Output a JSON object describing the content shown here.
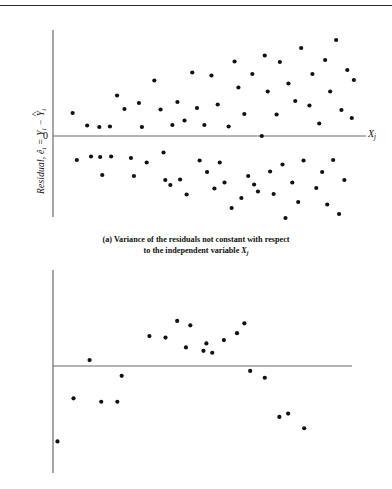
{
  "figure": {
    "top_rule": true,
    "panels": [
      {
        "id": "a",
        "tag": "(a)",
        "caption_line1": "(a)  Variance of the residuals not constant with respect",
        "caption_line2": "to the independent variable",
        "caption_var": "X",
        "caption_var_sub": "j",
        "ylabel_text": "Residual, ê",
        "ylabel_sub": "i",
        "ylabel_eq": " = Y",
        "ylabel_eq_sub": "i",
        "ylabel_minus": " − ",
        "ylabel_yhat": "Y",
        "ylabel_yhat_sub": "i",
        "zero_label": "0",
        "xlabel": "X",
        "xlabel_sub": "j"
      },
      {
        "id": "b",
        "tag": "(b)",
        "ylabel_text": "Residual, ê",
        "ylabel_sub": "i",
        "ylabel_eq": " = Y",
        "ylabel_eq_sub": "i",
        "ylabel_minus": " − ",
        "ylabel_yhat": "Y",
        "ylabel_yhat_sub": "i",
        "zero_label": "0",
        "xlabel": "X",
        "xlabel_sub": "j"
      }
    ]
  },
  "chart_data": [
    {
      "type": "scatter",
      "title": "(a) Variance of the residuals not constant with respect to the independent variable Xj",
      "xlabel": "Xj",
      "ylabel": "Residual, e-hat i = Yi - Y-hat i",
      "grid": false,
      "legend": null,
      "xlim": [
        0,
        100
      ],
      "ylim": [
        -100,
        100
      ],
      "zero_line": 0,
      "marker": "filled-circle",
      "marker_color": "#111111",
      "marker_size_px": 4.2,
      "axis_color": "#6a6a6a",
      "points": [
        [
          3.6,
          23.0
        ],
        [
          5.0,
          -24.0
        ],
        [
          8.5,
          10.5
        ],
        [
          9.8,
          -20.5
        ],
        [
          12.6,
          9.0
        ],
        [
          12.9,
          -21.0
        ],
        [
          13.6,
          -39.0
        ],
        [
          16.2,
          9.5
        ],
        [
          16.6,
          -20.5
        ],
        [
          18.6,
          40.5
        ],
        [
          21.1,
          27.0
        ],
        [
          23.3,
          -22.0
        ],
        [
          24.3,
          -40.0
        ],
        [
          26.0,
          33.0
        ],
        [
          27.0,
          9.0
        ],
        [
          28.6,
          -26.5
        ],
        [
          31.2,
          55.5
        ],
        [
          33.3,
          26.5
        ],
        [
          34.3,
          -16.5
        ],
        [
          34.9,
          -44.0
        ],
        [
          36.6,
          -49.0
        ],
        [
          37.3,
          11.0
        ],
        [
          39.0,
          34.0
        ],
        [
          39.9,
          -43.5
        ],
        [
          41.4,
          15.5
        ],
        [
          42.1,
          -58.5
        ],
        [
          44.0,
          63.5
        ],
        [
          45.6,
          28.0
        ],
        [
          46.5,
          -24.5
        ],
        [
          48.1,
          11.0
        ],
        [
          49.0,
          -36.0
        ],
        [
          50.5,
          60.5
        ],
        [
          51.5,
          -52.5
        ],
        [
          52.6,
          31.5
        ],
        [
          53.3,
          -26.5
        ],
        [
          54.9,
          -46.5
        ],
        [
          56.3,
          9.5
        ],
        [
          57.3,
          -72.0
        ],
        [
          58.3,
          74.5
        ],
        [
          59.6,
          48.5
        ],
        [
          60.6,
          -62.0
        ],
        [
          61.6,
          22.0
        ],
        [
          62.9,
          -40.0
        ],
        [
          64.3,
          62.0
        ],
        [
          64.9,
          -48.5
        ],
        [
          66.2,
          -55.5
        ],
        [
          67.5,
          0.0
        ],
        [
          68.5,
          80.5
        ],
        [
          69.5,
          44.5
        ],
        [
          70.3,
          -35.5
        ],
        [
          71.5,
          -58.0
        ],
        [
          72.5,
          21.5
        ],
        [
          73.6,
          74.0
        ],
        [
          74.5,
          -28.5
        ],
        [
          75.5,
          -82.0
        ],
        [
          76.5,
          52.5
        ],
        [
          77.8,
          -46.5
        ],
        [
          78.8,
          35.0
        ],
        [
          79.8,
          -66.0
        ],
        [
          80.8,
          88.0
        ],
        [
          81.6,
          -24.5
        ],
        [
          82.6,
          -92.0
        ],
        [
          83.6,
          30.5
        ],
        [
          84.6,
          62.0
        ],
        [
          85.9,
          -52.0
        ],
        [
          86.9,
          12.5
        ],
        [
          87.9,
          -36.0
        ],
        [
          88.9,
          76.0
        ],
        [
          89.6,
          -68.5
        ],
        [
          90.6,
          44.5
        ],
        [
          91.6,
          -24.0
        ],
        [
          92.6,
          96.0
        ],
        [
          93.6,
          -78.0
        ],
        [
          94.4,
          26.0
        ],
        [
          95.4,
          -44.0
        ],
        [
          96.4,
          66.0
        ],
        [
          97.2,
          -96.5
        ],
        [
          97.9,
          18.0
        ],
        [
          98.6,
          56.0
        ]
      ]
    },
    {
      "type": "scatter",
      "title": "(b) Residuals showing a curvilinear pattern",
      "xlabel": "Xj",
      "ylabel": "Residual, e-hat i = Yi - Y-hat i",
      "grid": false,
      "legend": null,
      "xlim": [
        0,
        100
      ],
      "ylim": [
        -100,
        100
      ],
      "zero_line": 0,
      "marker": "filled-circle",
      "marker_color": "#111111",
      "marker_size_px": 4.2,
      "axis_color": "#6a6a6a",
      "points": [
        [
          0.5,
          -77.0
        ],
        [
          6.0,
          -33.0
        ],
        [
          11.5,
          6.0
        ],
        [
          15.5,
          -36.5
        ],
        [
          21.0,
          -36.5
        ],
        [
          22.5,
          -10.0
        ],
        [
          32.0,
          30.5
        ],
        [
          37.5,
          29.0
        ],
        [
          41.5,
          46.0
        ],
        [
          46.0,
          41.5
        ],
        [
          44.5,
          19.0
        ],
        [
          50.5,
          15.5
        ],
        [
          53.5,
          13.5
        ],
        [
          51.5,
          23.0
        ],
        [
          57.5,
          26.5
        ],
        [
          62.0,
          33.5
        ],
        [
          64.5,
          43.5
        ],
        [
          66.5,
          -5.0
        ],
        [
          71.5,
          -12.0
        ],
        [
          76.5,
          -52.0
        ],
        [
          79.5,
          -48.5
        ],
        [
          85.0,
          -63.5
        ]
      ]
    }
  ]
}
